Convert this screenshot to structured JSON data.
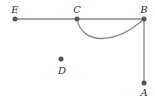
{
  "diagram": {
    "type": "graph",
    "colors": {
      "edge": "#888888",
      "node": "#555555",
      "label": "#333333"
    },
    "nodes": [
      {
        "id": "E",
        "label": "E",
        "x": 15,
        "y": 19,
        "label_x": 15,
        "label_y": 12
      },
      {
        "id": "C",
        "label": "C",
        "x": 77,
        "y": 19,
        "label_x": 77,
        "label_y": 12
      },
      {
        "id": "B",
        "label": "B",
        "x": 144,
        "y": 19,
        "label_x": 144,
        "label_y": 12
      },
      {
        "id": "D",
        "label": "D",
        "x": 61,
        "y": 59,
        "label_x": 62,
        "label_y": 73
      },
      {
        "id": "A",
        "label": "A",
        "x": 144,
        "y": 83,
        "label_x": 144,
        "label_y": 96
      }
    ],
    "edges": [
      {
        "from": "E",
        "to": "C",
        "kind": "straight"
      },
      {
        "from": "C",
        "to": "B",
        "kind": "straight"
      },
      {
        "from": "C",
        "to": "B",
        "kind": "curved"
      },
      {
        "from": "B",
        "to": "A",
        "kind": "straight"
      }
    ]
  }
}
